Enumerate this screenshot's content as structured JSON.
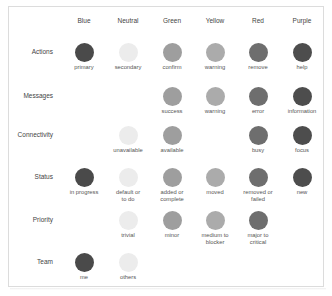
{
  "colors": {
    "blue": "#4a4a4a",
    "neutral": "#ececec",
    "green": "#9e9e9e",
    "yellow": "#ababab",
    "red": "#6e6e6e",
    "purple": "#4d4d4d"
  },
  "columns": [
    "Blue",
    "Neutral",
    "Green",
    "Yellow",
    "Red",
    "Purple"
  ],
  "rows": [
    {
      "label": "Actions",
      "cells": {
        "Blue": "primary",
        "Neutral": "secondary",
        "Green": "confirm",
        "Yellow": "warning",
        "Red": "remove",
        "Purple": "help"
      }
    },
    {
      "label": "Messages",
      "cells": {
        "Green": "success",
        "Yellow": "warning",
        "Red": "error",
        "Purple": "information"
      }
    },
    {
      "label": "Connectivity",
      "cells": {
        "Neutral": "unavailable",
        "Green": "available",
        "Red": "busy",
        "Purple": "focus"
      }
    },
    {
      "label": "Status",
      "cells": {
        "Blue": "in progress",
        "Neutral": "default or\nto do",
        "Green": "added or\ncomplete",
        "Yellow": "moved",
        "Red": "removed or\nfailed",
        "Purple": "new"
      }
    },
    {
      "label": "Priority",
      "cells": {
        "Neutral": "trivial",
        "Green": "minor",
        "Yellow": "medium to\nblocker",
        "Red": "major to\ncritical"
      }
    },
    {
      "label": "Team",
      "cells": {
        "Blue": "me",
        "Neutral": "others"
      }
    }
  ]
}
